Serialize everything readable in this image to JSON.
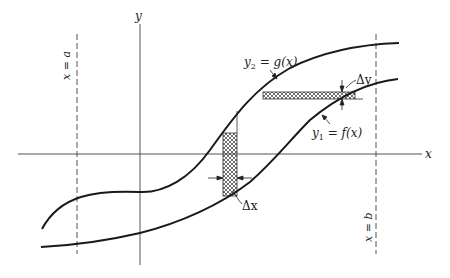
{
  "figure": {
    "axis_x_label": "x",
    "axis_y_label": "y",
    "line_a_label": "x = a",
    "line_b_label": "x = b",
    "curve_upper_label_var": "y",
    "curve_upper_label_sub": "2",
    "curve_upper_label_rest": " = g(x)",
    "curve_lower_label_var": "y",
    "curve_lower_label_sub": "1",
    "curve_lower_label_rest": " = f(x)",
    "delta_x_label": "Δx",
    "delta_y_label": "Δy"
  },
  "colors": {
    "ink": "#1a1a1a",
    "axis": "#555555",
    "background": "#ffffff"
  }
}
